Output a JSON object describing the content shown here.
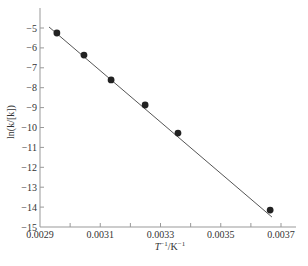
{
  "chart_data": {
    "type": "scatter",
    "title": "",
    "xlabel": "T^-1/K^-1",
    "xlabel_parts": {
      "base": "T",
      "sup1": "−1",
      "unit": "/K",
      "sup2": "−1"
    },
    "ylabel": "ln(k/[k])",
    "xlim": [
      0.0029,
      0.0037
    ],
    "ylim": [
      -15,
      -4.0
    ],
    "x_ticks": [
      0.0029,
      0.003,
      0.0031,
      0.0032,
      0.0033,
      0.0034,
      0.0035,
      0.0036,
      0.0037
    ],
    "x_tick_labels": [
      "0.0029",
      "",
      "0.0031",
      "",
      "0.0033",
      "",
      "0.0035",
      "",
      "0.0037"
    ],
    "y_ticks": [
      -5,
      -6,
      -7,
      -8,
      -9,
      -10,
      -11,
      -12,
      -13,
      -14,
      -15
    ],
    "y_tick_labels": [
      "−5",
      "−6",
      "−7",
      "−8",
      "−9",
      "−10",
      "−11",
      "−12",
      "−13",
      "−14",
      "−15"
    ],
    "grid": false,
    "legend": null,
    "series": [
      {
        "name": "data",
        "marker": "filled-circle",
        "color": "#222222",
        "x": [
          0.002956,
          0.003046,
          0.003136,
          0.003249,
          0.003358,
          0.003664
        ],
        "y": [
          -5.25,
          -6.36,
          -7.61,
          -8.87,
          -10.28,
          -14.15
        ]
      },
      {
        "name": "linear fit",
        "style": "line",
        "color": "#444444",
        "x": [
          0.00293,
          0.00367
        ],
        "y": [
          -4.95,
          -14.5
        ]
      }
    ]
  },
  "colors": {
    "axis": "#999999",
    "marker": "#222222",
    "line": "#555555",
    "text": "#333333"
  }
}
